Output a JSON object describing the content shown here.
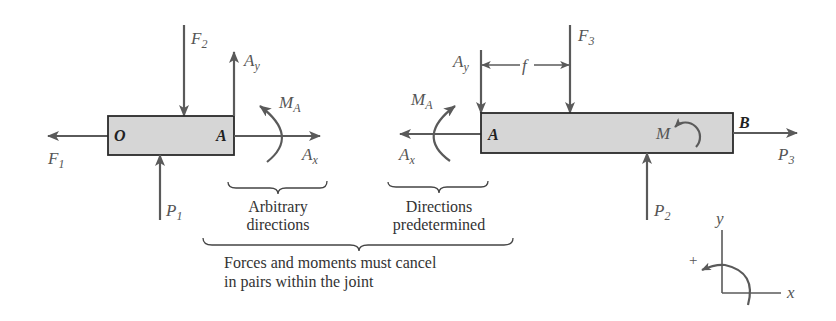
{
  "figure": {
    "left_member": {
      "points": {
        "left_end": "O",
        "right_end": "A"
      },
      "forces": {
        "F1": {
          "main": "F",
          "sub": "1",
          "direction": "left"
        },
        "F2": {
          "main": "F",
          "sub": "2",
          "direction": "down"
        },
        "P1": {
          "main": "P",
          "sub": "1",
          "direction": "up"
        },
        "Ay": {
          "main": "A",
          "sub": "y",
          "direction": "up"
        },
        "Ax": {
          "main": "A",
          "sub": "x",
          "direction": "right"
        }
      },
      "moment": {
        "main": "M",
        "sub": "A",
        "direction": "counterclockwise"
      }
    },
    "right_member": {
      "points": {
        "left_end": "A",
        "right_end": "B",
        "internal": "M"
      },
      "forces": {
        "F3": {
          "main": "F",
          "sub": "3",
          "direction": "down"
        },
        "P2": {
          "main": "P",
          "sub": "2",
          "direction": "up"
        },
        "P3": {
          "main": "P",
          "sub": "3",
          "direction": "right"
        },
        "Ay": {
          "main": "A",
          "sub": "y",
          "direction": "down"
        },
        "Ax": {
          "main": "A",
          "sub": "x",
          "direction": "left"
        }
      },
      "moment": {
        "main": "M",
        "sub": "A",
        "direction": "clockwise"
      },
      "dimension": {
        "label": "f"
      }
    },
    "annotations": {
      "left_brace": [
        "Arbitrary",
        "directions"
      ],
      "right_brace": [
        "Directions",
        "predetermined"
      ],
      "bottom_brace": [
        "Forces and moments must cancel",
        "in pairs within the joint"
      ]
    },
    "axes": {
      "x_label": "x",
      "y_label": "y",
      "positive_sign": "+"
    },
    "colors": {
      "arrow": "#5a5a5a",
      "bar_fill": "#d6d6d6",
      "bar_stroke": "#2a2a2a",
      "text": "#333333"
    }
  }
}
